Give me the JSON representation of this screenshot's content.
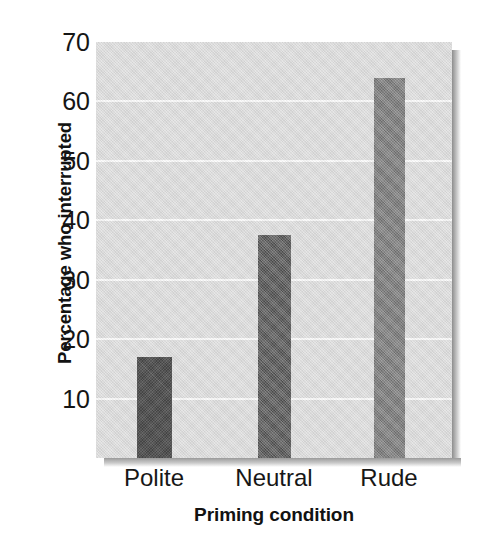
{
  "chart_data": {
    "type": "bar",
    "title": "",
    "subtitle": "",
    "xlabel": "Priming condition",
    "ylabel": "Percentage who interrupted",
    "categories": [
      "Polite",
      "Neutral",
      "Rude"
    ],
    "values": [
      17,
      37.5,
      64
    ],
    "series": [
      {
        "name": "Percentage who interrupted",
        "values": [
          17,
          37.5,
          64
        ]
      }
    ],
    "bar_colors": [
      "#3a3a3a",
      "#545454",
      "#7a7a7a"
    ],
    "ylim": [
      0,
      70
    ],
    "yticks": [
      10,
      20,
      30,
      40,
      50,
      60,
      70
    ],
    "ytick_labels": [
      "10",
      "20",
      "30",
      "40",
      "50",
      "60",
      "70"
    ],
    "xtick_labels": [
      "Polite",
      "Neutral",
      "Rude"
    ],
    "grid": "horizontal",
    "gridline_color": "#fbfbfb",
    "legend": null,
    "legend_position": "none",
    "panel_background": "#dedede",
    "annotations": []
  },
  "figure": {
    "background": "#ffffff",
    "axis_text_color": "#151515",
    "axis_title_color": "#121212"
  }
}
